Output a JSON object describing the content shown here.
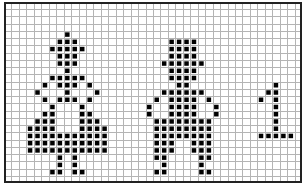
{
  "pattern": {
    "columns": 40,
    "rows": 25,
    "colors": {
      "background": "#ffffff",
      "grid_line": "#b4b4b4",
      "grid_line_major": "#8c8c8c",
      "border": "#222222",
      "filled": "#000000"
    },
    "figures": [
      {
        "name": "figure-dress",
        "cells": [
          [
            4,
            8
          ],
          [
            5,
            7
          ],
          [
            5,
            8
          ],
          [
            5,
            9
          ],
          [
            6,
            6
          ],
          [
            6,
            7
          ],
          [
            6,
            8
          ],
          [
            6,
            9
          ],
          [
            6,
            10
          ],
          [
            7,
            7
          ],
          [
            7,
            8
          ],
          [
            7,
            9
          ],
          [
            8,
            7
          ],
          [
            8,
            8
          ],
          [
            8,
            9
          ],
          [
            9,
            8
          ],
          [
            10,
            6
          ],
          [
            10,
            7
          ],
          [
            10,
            8
          ],
          [
            10,
            9
          ],
          [
            10,
            10
          ],
          [
            11,
            5
          ],
          [
            11,
            7
          ],
          [
            11,
            8
          ],
          [
            11,
            9
          ],
          [
            11,
            11
          ],
          [
            12,
            4
          ],
          [
            12,
            8
          ],
          [
            12,
            12
          ],
          [
            13,
            5
          ],
          [
            13,
            7
          ],
          [
            13,
            8
          ],
          [
            13,
            9
          ],
          [
            13,
            11
          ],
          [
            14,
            6
          ],
          [
            14,
            10
          ],
          [
            15,
            5
          ],
          [
            15,
            6
          ],
          [
            15,
            10
          ],
          [
            15,
            11
          ],
          [
            16,
            4
          ],
          [
            16,
            5
          ],
          [
            16,
            6
          ],
          [
            16,
            10
          ],
          [
            16,
            11
          ],
          [
            16,
            12
          ],
          [
            17,
            3
          ],
          [
            17,
            4
          ],
          [
            17,
            5
          ],
          [
            17,
            6
          ],
          [
            17,
            10
          ],
          [
            17,
            11
          ],
          [
            17,
            12
          ],
          [
            17,
            13
          ],
          [
            18,
            3
          ],
          [
            18,
            4
          ],
          [
            18,
            5
          ],
          [
            18,
            6
          ],
          [
            18,
            7
          ],
          [
            18,
            8
          ],
          [
            18,
            9
          ],
          [
            18,
            10
          ],
          [
            18,
            11
          ],
          [
            18,
            12
          ],
          [
            18,
            13
          ],
          [
            19,
            3
          ],
          [
            19,
            4
          ],
          [
            19,
            5
          ],
          [
            19,
            6
          ],
          [
            19,
            7
          ],
          [
            19,
            8
          ],
          [
            19,
            9
          ],
          [
            19,
            10
          ],
          [
            19,
            11
          ],
          [
            19,
            12
          ],
          [
            19,
            13
          ],
          [
            20,
            3
          ],
          [
            20,
            4
          ],
          [
            20,
            5
          ],
          [
            20,
            6
          ],
          [
            20,
            7
          ],
          [
            20,
            8
          ],
          [
            20,
            9
          ],
          [
            20,
            10
          ],
          [
            20,
            11
          ],
          [
            20,
            12
          ],
          [
            20,
            13
          ],
          [
            21,
            7
          ],
          [
            21,
            9
          ],
          [
            22,
            7
          ],
          [
            22,
            9
          ],
          [
            23,
            6
          ],
          [
            23,
            7
          ],
          [
            23,
            9
          ],
          [
            23,
            10
          ]
        ]
      },
      {
        "name": "figure-trousers",
        "cells": [
          [
            5,
            22
          ],
          [
            5,
            23
          ],
          [
            5,
            24
          ],
          [
            5,
            25
          ],
          [
            6,
            22
          ],
          [
            6,
            23
          ],
          [
            6,
            24
          ],
          [
            6,
            25
          ],
          [
            7,
            22
          ],
          [
            7,
            23
          ],
          [
            7,
            24
          ],
          [
            7,
            25
          ],
          [
            8,
            21
          ],
          [
            8,
            22
          ],
          [
            8,
            23
          ],
          [
            8,
            24
          ],
          [
            8,
            25
          ],
          [
            8,
            26
          ],
          [
            9,
            22
          ],
          [
            9,
            23
          ],
          [
            9,
            24
          ],
          [
            9,
            25
          ],
          [
            10,
            22
          ],
          [
            10,
            23
          ],
          [
            10,
            24
          ],
          [
            10,
            25
          ],
          [
            11,
            23
          ],
          [
            11,
            24
          ],
          [
            12,
            21
          ],
          [
            12,
            22
          ],
          [
            12,
            23
          ],
          [
            12,
            24
          ],
          [
            12,
            25
          ],
          [
            12,
            26
          ],
          [
            13,
            20
          ],
          [
            13,
            22
          ],
          [
            13,
            23
          ],
          [
            13,
            24
          ],
          [
            13,
            25
          ],
          [
            13,
            27
          ],
          [
            14,
            19
          ],
          [
            14,
            22
          ],
          [
            14,
            23
          ],
          [
            14,
            24
          ],
          [
            14,
            25
          ],
          [
            14,
            28
          ],
          [
            15,
            19
          ],
          [
            15,
            22
          ],
          [
            15,
            23
          ],
          [
            15,
            24
          ],
          [
            15,
            25
          ],
          [
            15,
            28
          ],
          [
            16,
            20
          ],
          [
            16,
            21
          ],
          [
            16,
            22
          ],
          [
            16,
            23
          ],
          [
            16,
            24
          ],
          [
            16,
            25
          ],
          [
            16,
            26
          ],
          [
            16,
            27
          ],
          [
            17,
            20
          ],
          [
            17,
            21
          ],
          [
            17,
            22
          ],
          [
            17,
            23
          ],
          [
            17,
            24
          ],
          [
            17,
            25
          ],
          [
            17,
            26
          ],
          [
            17,
            27
          ],
          [
            18,
            20
          ],
          [
            18,
            21
          ],
          [
            18,
            22
          ],
          [
            18,
            23
          ],
          [
            18,
            24
          ],
          [
            18,
            25
          ],
          [
            18,
            26
          ],
          [
            18,
            27
          ],
          [
            19,
            20
          ],
          [
            19,
            21
          ],
          [
            19,
            22
          ],
          [
            19,
            25
          ],
          [
            19,
            26
          ],
          [
            19,
            27
          ],
          [
            20,
            20
          ],
          [
            20,
            21
          ],
          [
            20,
            22
          ],
          [
            20,
            25
          ],
          [
            20,
            26
          ],
          [
            20,
            27
          ],
          [
            21,
            20
          ],
          [
            21,
            21
          ],
          [
            21,
            26
          ],
          [
            21,
            27
          ],
          [
            22,
            21
          ],
          [
            22,
            26
          ],
          [
            23,
            20
          ],
          [
            23,
            21
          ],
          [
            23,
            26
          ],
          [
            23,
            27
          ]
        ]
      },
      {
        "name": "numeral-one",
        "cells": [
          [
            11,
            36
          ],
          [
            12,
            35
          ],
          [
            12,
            36
          ],
          [
            13,
            34
          ],
          [
            13,
            36
          ],
          [
            14,
            36
          ],
          [
            15,
            36
          ],
          [
            16,
            36
          ],
          [
            17,
            36
          ],
          [
            18,
            34
          ],
          [
            18,
            35
          ],
          [
            18,
            36
          ],
          [
            18,
            37
          ],
          [
            18,
            38
          ]
        ]
      }
    ]
  }
}
